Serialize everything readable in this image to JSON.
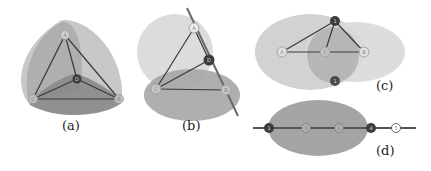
{
  "figure": {
    "panels": [
      {
        "id": "a",
        "caption": "(a)",
        "nodes": [
          {
            "label": "A",
            "type": "light"
          },
          {
            "label": "D",
            "type": "dark"
          },
          {
            "label": "C",
            "type": "light"
          },
          {
            "label": "B",
            "type": "light"
          }
        ],
        "edges": [
          [
            "A",
            "C"
          ],
          [
            "A",
            "B"
          ],
          [
            "A",
            "D"
          ],
          [
            "C",
            "D"
          ],
          [
            "D",
            "B"
          ],
          [
            "C",
            "B"
          ]
        ]
      },
      {
        "id": "b",
        "caption": "(b)",
        "nodes": [
          {
            "label": "A",
            "type": "light"
          },
          {
            "label": "D",
            "type": "dark"
          },
          {
            "label": "C",
            "type": "light"
          },
          {
            "label": "B",
            "type": "light"
          }
        ],
        "edges": [
          [
            "A",
            "C"
          ],
          [
            "C",
            "D"
          ],
          [
            "C",
            "B"
          ],
          [
            "A",
            "D"
          ],
          [
            "D",
            "B"
          ]
        ]
      },
      {
        "id": "c",
        "caption": "(c)",
        "nodes": [
          {
            "label": "1",
            "type": "dark"
          },
          {
            "label": "A",
            "type": "light"
          },
          {
            "label": "C",
            "type": "light"
          },
          {
            "label": "B",
            "type": "light"
          },
          {
            "label": "1",
            "type": "dark"
          }
        ],
        "edges": [
          [
            "1",
            "A"
          ],
          [
            "1",
            "C"
          ],
          [
            "1",
            "B"
          ],
          [
            "A",
            "C"
          ],
          [
            "C",
            "B"
          ]
        ]
      },
      {
        "id": "d",
        "caption": "(d)",
        "nodes": [
          {
            "label": "1",
            "type": "dark"
          },
          {
            "label": "3",
            "type": "light"
          },
          {
            "label": "2",
            "type": "light"
          },
          {
            "label": "4",
            "type": "dark"
          },
          {
            "label": "5",
            "type": "light"
          }
        ]
      }
    ],
    "colors": {
      "region_dark": "#8f8f8f",
      "region_mid": "#b4b4b4",
      "region_light": "#d6d6d6",
      "edge": "#3a3a3a",
      "node_dark": "#3c3c3c",
      "node_light_stroke": "#999999"
    }
  }
}
